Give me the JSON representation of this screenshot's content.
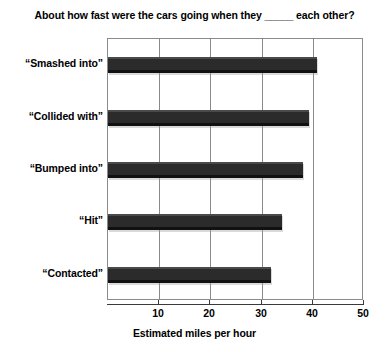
{
  "chart_data": {
    "type": "bar",
    "orientation": "horizontal",
    "title": "About how fast were the cars going when they _____ each other?",
    "xlabel": "Estimated miles per hour",
    "ylabel": "",
    "categories": [
      "“Smashed into”",
      "“Collided with”",
      "“Bumped into”",
      "“Hit”",
      "“Contacted”"
    ],
    "values": [
      40.8,
      39.3,
      38.1,
      34.0,
      31.8
    ],
    "xlim": [
      0,
      50
    ],
    "xticks": [
      10,
      20,
      30,
      40,
      50
    ],
    "xtick_labels": [
      "10",
      "20",
      "30",
      "40",
      "50"
    ],
    "grid": "vertical",
    "legend": "none",
    "bar_color": "#2b2b2b"
  }
}
